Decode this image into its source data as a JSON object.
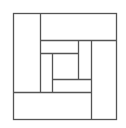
{
  "diagram": {
    "title": "",
    "stroke_color": "#555555",
    "background": "#ffffff",
    "outer": {
      "x": 13,
      "y": 13,
      "w": 103,
      "h": 106
    },
    "segments": [
      {
        "x1": 40,
        "y1": 13,
        "x2": 40,
        "y2": 92
      },
      {
        "x1": 40,
        "y1": 40,
        "x2": 116,
        "y2": 40
      },
      {
        "x1": 91,
        "y1": 40,
        "x2": 91,
        "y2": 119
      },
      {
        "x1": 13,
        "y1": 92,
        "x2": 91,
        "y2": 92
      },
      {
        "x1": 40,
        "y1": 53,
        "x2": 78,
        "y2": 53
      },
      {
        "x1": 78,
        "y1": 40,
        "x2": 78,
        "y2": 79
      },
      {
        "x1": 52,
        "y1": 53,
        "x2": 52,
        "y2": 92
      },
      {
        "x1": 52,
        "y1": 79,
        "x2": 91,
        "y2": 79
      }
    ]
  }
}
